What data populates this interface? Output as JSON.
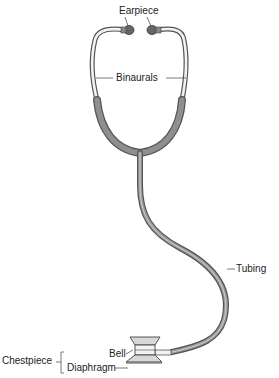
{
  "labels": {
    "earpiece": "Earpiece",
    "binaurals": "Binaurals",
    "tubing": "Tubing",
    "bell": "Bell",
    "diaphragm": "Diaphragm",
    "chestpiece": "Chestpiece"
  },
  "colors": {
    "tube_dark": "#555555",
    "tube_fill": "#8f8f8f",
    "tube_highlight": "#c9c9c9",
    "metal_outline": "#555555",
    "metal_fill": "#f2f2f2",
    "chestpiece_fill": "#d8d8d8"
  }
}
